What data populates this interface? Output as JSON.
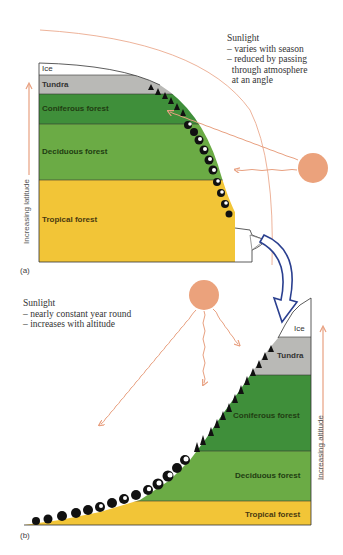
{
  "colors": {
    "ice": "#ffffff",
    "tundra": "#b9b9b6",
    "coniferous": "#3f8f3a",
    "deciduous": "#6bab45",
    "tropical": "#f2c537",
    "sun": "#eba27c",
    "arrow": "#e8a080",
    "blue_arrow": "#2a3f8f",
    "text": "#333333"
  },
  "panel_a": {
    "label": "(a)",
    "axis_label": "Increasing latitude",
    "sunlight_note": {
      "title": "Sunlight",
      "lines": [
        "– varies with season",
        "– reduced by passing",
        "  through atmosphere",
        "  at an angle"
      ]
    },
    "bands": [
      {
        "name": "Ice"
      },
      {
        "name": "Tundra"
      },
      {
        "name": "Coniferous forest"
      },
      {
        "name": "Deciduous forest"
      },
      {
        "name": "Tropical forest"
      }
    ]
  },
  "panel_b": {
    "label": "(b)",
    "axis_label": "Increasing altitude",
    "sunlight_note": {
      "title": "Sunlight",
      "lines": [
        "– nearly constant year round",
        "– increases with altitude"
      ]
    },
    "bands": [
      {
        "name": "Ice"
      },
      {
        "name": "Tundra"
      },
      {
        "name": "Coniferous forest"
      },
      {
        "name": "Deciduous forest"
      },
      {
        "name": "Tropical forest"
      }
    ]
  }
}
